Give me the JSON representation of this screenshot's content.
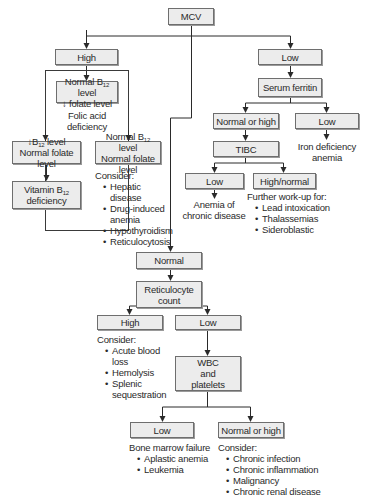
{
  "root": {
    "label": "MCV"
  },
  "high_branch": {
    "label": "High",
    "folate_box": {
      "line1_prefix": "Normal B",
      "line1_sub": "12",
      "line1_suffix": " level",
      "line2": "↓ folate level"
    },
    "folate_result": "Folic acid deficiency",
    "b12_low_box": {
      "line1_prefix": "↓B",
      "line1_sub": "12",
      "line1_suffix": " level",
      "line2": "Normal folate level"
    },
    "b12_result_box": {
      "line1_prefix": "Vitamin B",
      "line1_sub": "12",
      "line2": "deficiency"
    },
    "normal_box": {
      "line1_prefix": "Normal B",
      "line1_sub": "12",
      "line1_suffix": " level",
      "line2": "Normal folate level"
    },
    "consider": {
      "heading": "Consider:",
      "items": [
        "Hepatic disease",
        "Drug-induced anemia",
        "Hypothyroidism",
        "Reticulocytosis"
      ]
    }
  },
  "low_branch": {
    "label": "Low",
    "serum_ferritin": "Serum ferritin",
    "ferritin_normal_high": "Normal or high",
    "ferritin_low": "Low",
    "iron_deficiency": "Iron deficiency anemia",
    "tibc": "TIBC",
    "tibc_low": "Low",
    "tibc_high_normal": "High/normal",
    "chronic_disease": "Anemia of chronic disease",
    "further_workup": {
      "heading": "Further work-up for:",
      "items": [
        "Lead intoxication",
        "Thalassemias",
        "Sideroblastic"
      ]
    }
  },
  "normal_branch": {
    "label": "Normal",
    "reticulocyte": {
      "line1": "Reticulocyte",
      "line2": "count"
    },
    "retic_high": "High",
    "retic_low": "Low",
    "retic_high_consider": {
      "heading": "Consider:",
      "items": [
        "Acute blood loss",
        "Hemolysis",
        "Splenic sequestration"
      ]
    },
    "wbc": {
      "line1": "WBC",
      "line2": "and",
      "line3": "platelets"
    },
    "wbc_low": "Low",
    "wbc_normal_high": "Normal or high",
    "bone_marrow": {
      "heading": "Bone marrow failure",
      "items": [
        "Aplastic anemia",
        "Leukemia"
      ]
    },
    "wbc_consider": {
      "heading": "Consider:",
      "items": [
        "Chronic infection",
        "Chronic inflammation",
        "Malignancy",
        "Chronic renal disease"
      ]
    }
  }
}
